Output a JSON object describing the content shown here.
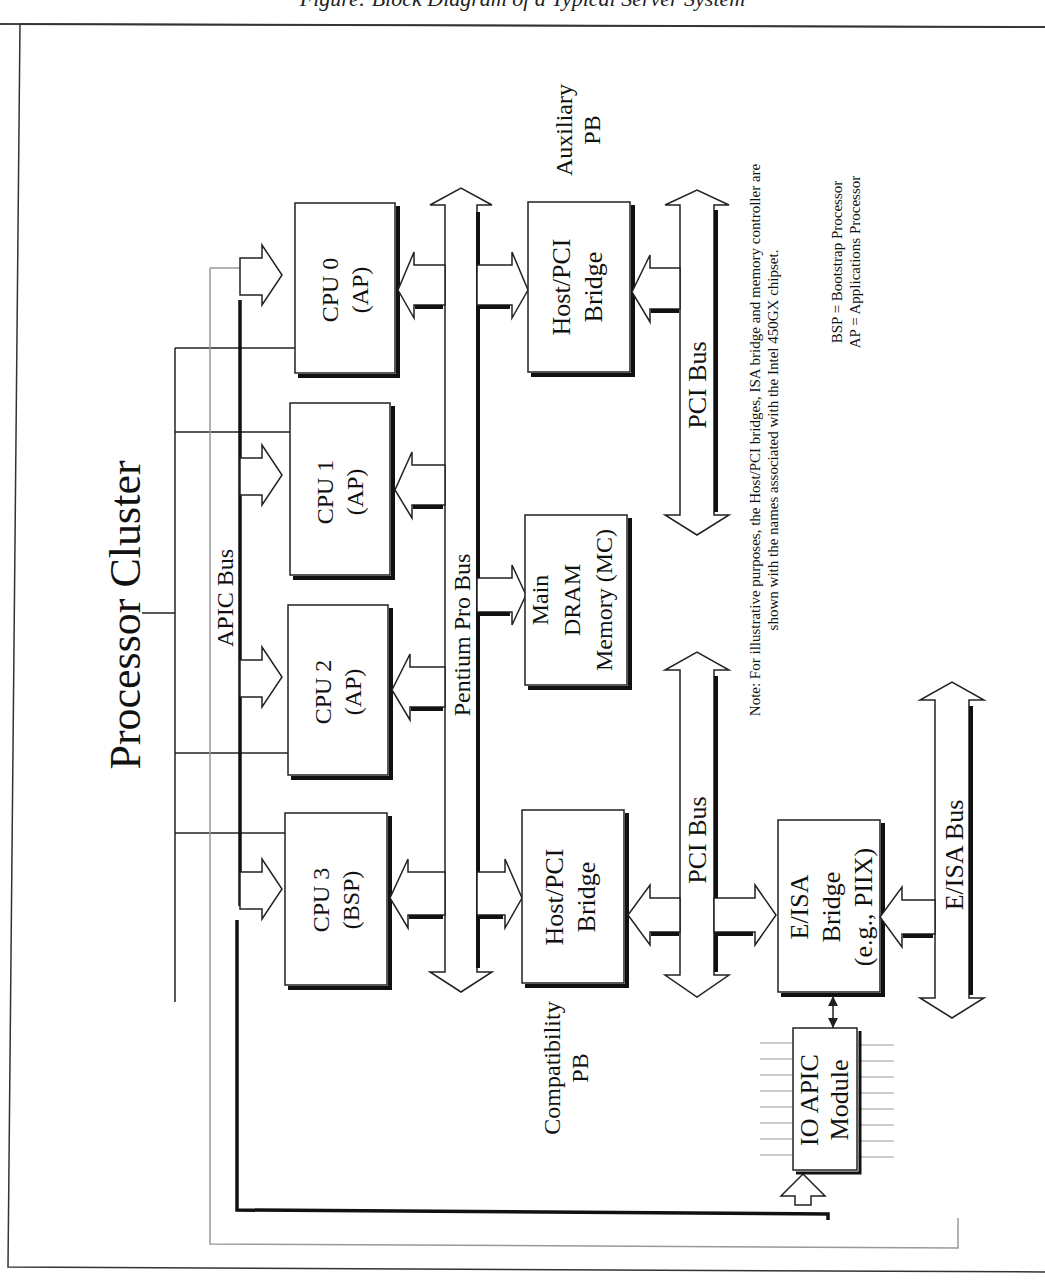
{
  "caption": "Figure: Block Diagram of a Typical Server System",
  "title": "Processor Cluster",
  "buses": {
    "apic": "APIC Bus",
    "pentium_pro": "Pentium Pro Bus",
    "pci_upper": "PCI Bus",
    "pci_lower": "PCI Bus",
    "eisa": "E/ISA Bus"
  },
  "cpus": [
    {
      "name": "CPU 0",
      "role": "(AP)"
    },
    {
      "name": "CPU 1",
      "role": "(AP)"
    },
    {
      "name": "CPU 2",
      "role": "(AP)"
    },
    {
      "name": "CPU 3",
      "role": "(BSP)"
    }
  ],
  "blocks": {
    "aux_bridge": {
      "line1": "Host/PCI",
      "line2": "Bridge"
    },
    "aux_label": {
      "line1": "Auxiliary",
      "line2": "PB"
    },
    "memory": {
      "line1": "Main",
      "line2": "DRAM",
      "line3": "Memory (MC)"
    },
    "compat_bridge": {
      "line1": "Host/PCI",
      "line2": "Bridge"
    },
    "compat_label": {
      "line1": "Compatibility",
      "line2": "PB"
    },
    "eisa_bridge": {
      "line1": "E/ISA",
      "line2": "Bridge",
      "line3": "(e.g., PIIX)"
    },
    "io_apic": {
      "line1": "IO APIC",
      "line2": "Module"
    }
  },
  "note": {
    "line1": "Note: For illustrative purposes, the Host/PCI bridges, ISA bridge and memory controller are",
    "line2": "shown with the names associated with the Intel 450GX chipset."
  },
  "legend": {
    "bsp": "BSP = Bootstrap Processor",
    "ap": "AP = Applications Processor"
  }
}
